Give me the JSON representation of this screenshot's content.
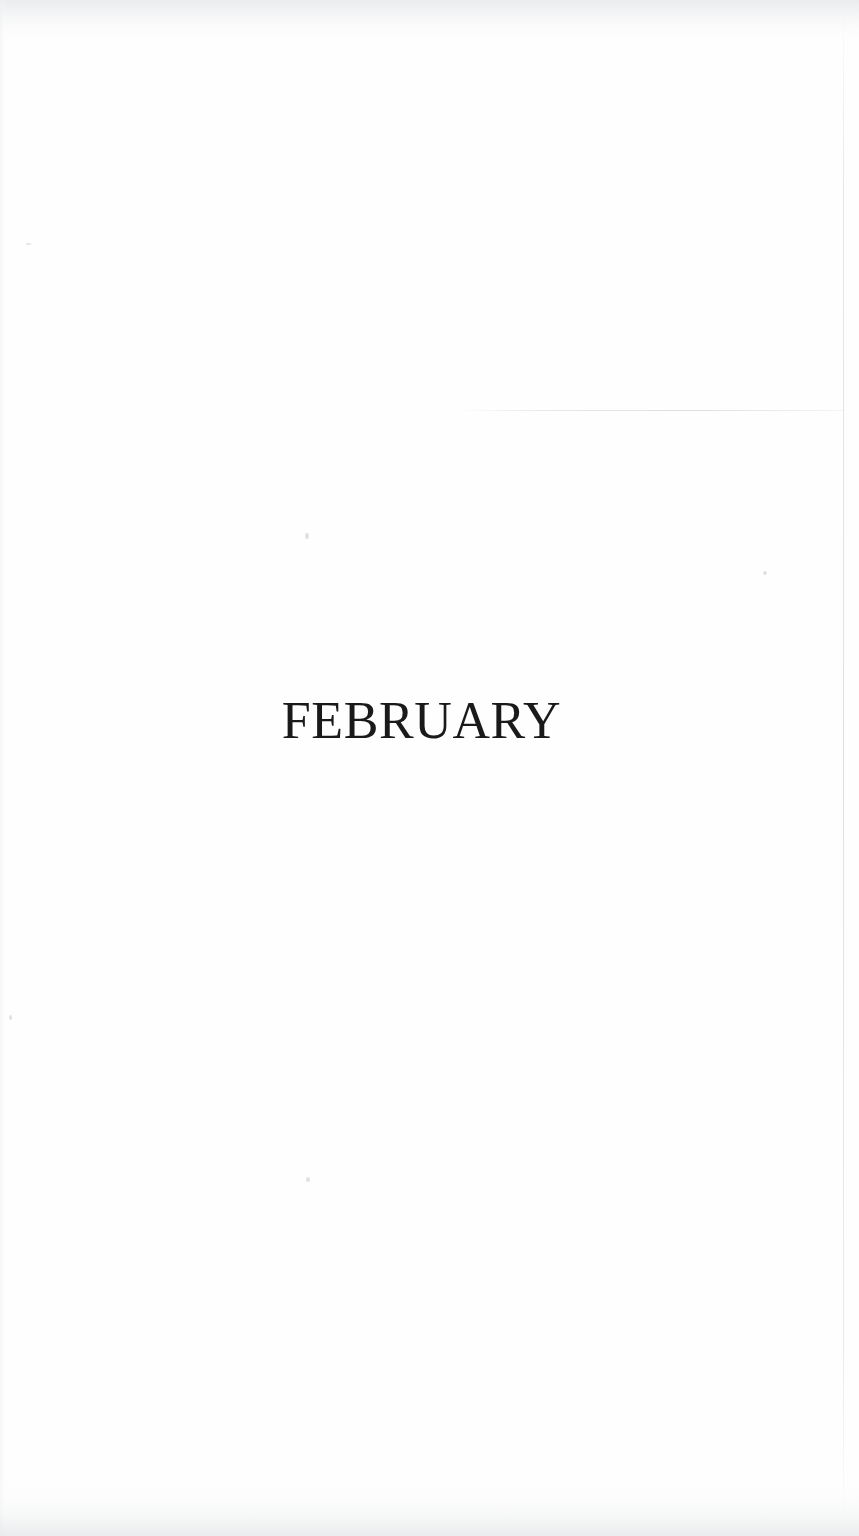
{
  "document": {
    "type": "scanned-book-page",
    "page_background_color": "#fefefe",
    "text_color": "#1a1a1a",
    "heading": {
      "text": "FEBRUARY",
      "style": "serif-caps",
      "alignment": "center"
    }
  },
  "artifacts": {
    "right_page_edge_line": "vertical-scan-edge",
    "horizontal_scan_line": "horizontal-scan-artifact",
    "top_edge_texture": "scan-shadow-top",
    "bottom_edge_texture": "scan-shadow-bottom",
    "specks": [
      "speck-1",
      "speck-2",
      "speck-3",
      "speck-4",
      "speck-5"
    ]
  }
}
